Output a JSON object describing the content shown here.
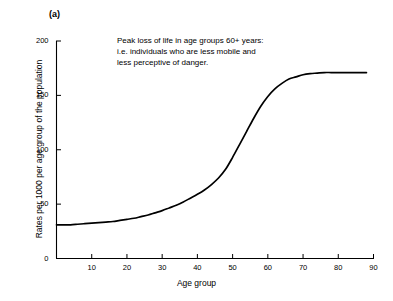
{
  "panel": {
    "label": "(a)"
  },
  "chart_data": {
    "type": "line",
    "title": "",
    "panel_label": "(a)",
    "xlabel": "Age group",
    "ylabel": "Rates per 1000 per age group of the population",
    "xlim": [
      0,
      90
    ],
    "ylim": [
      0,
      200
    ],
    "xticks": [
      10,
      20,
      30,
      40,
      50,
      60,
      70,
      80,
      90
    ],
    "yticks": [
      0,
      50,
      100,
      150,
      200
    ],
    "xtick_labels": [
      "10",
      "20",
      "30",
      "40",
      "50",
      "60",
      "70",
      "80",
      "90"
    ],
    "ytick_labels": [
      "0",
      "50",
      "100",
      "150",
      "200"
    ],
    "grid": false,
    "legend": false,
    "line_color": "#000000",
    "annotations": [
      {
        "lines": [
          "Peak loss of life in age groups 60+ years:",
          "i.e. individuals who are less mobile and",
          "less perceptive of danger."
        ]
      }
    ],
    "series": [
      {
        "name": "Rates per 1000 per age group",
        "x": [
          0,
          2,
          4,
          6,
          8,
          10,
          12,
          14,
          16,
          18,
          20,
          22,
          24,
          26,
          28,
          30,
          32,
          34,
          36,
          38,
          40,
          42,
          44,
          46,
          48,
          50,
          52,
          54,
          56,
          58,
          60,
          62,
          64,
          66,
          68,
          70,
          72,
          74,
          76,
          78,
          80,
          82,
          84,
          86,
          88
        ],
        "y": [
          31,
          31,
          31,
          31.5,
          32,
          32.5,
          33,
          33.5,
          34,
          35,
          36,
          37,
          38.5,
          40,
          42,
          44,
          46.5,
          49,
          52,
          55.5,
          59,
          63,
          68,
          74,
          82,
          93,
          105,
          117,
          129,
          140,
          149,
          156,
          161,
          165,
          167,
          169,
          170,
          170.5,
          171,
          171,
          171,
          171,
          171,
          171,
          171
        ]
      }
    ]
  },
  "axis": {
    "x_label": "Age group",
    "y_label": "Rates per 1000 per age group of the population"
  }
}
